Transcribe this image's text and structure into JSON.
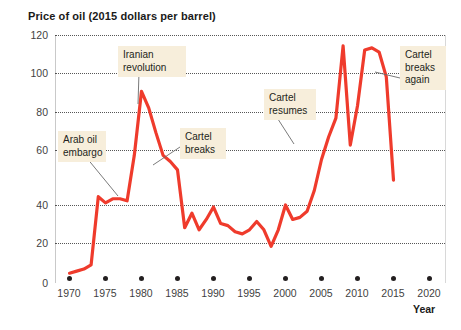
{
  "chart_data": {
    "type": "line",
    "title": "Price of oil (2015 dollars per barrel)",
    "xlabel": "Year",
    "ylabel": "",
    "xlim": [
      1968,
      2022
    ],
    "ylim": [
      0,
      120
    ],
    "grid": true,
    "legend_position": "none",
    "line_color": "#ef3b2c",
    "annotation_bg": "#f7eedb",
    "y_ticks": [
      0,
      20,
      40,
      60,
      80,
      100,
      120
    ],
    "x_ticks": [
      1970,
      1975,
      1980,
      1985,
      1990,
      1995,
      2000,
      2005,
      2010,
      2015,
      2020
    ],
    "series": [
      {
        "name": "Price of oil (2015 dollars per barrel)",
        "x": [
          1970,
          1971,
          1972,
          1973,
          1974,
          1975,
          1976,
          1977,
          1978,
          1979,
          1980,
          1981,
          1982,
          1983,
          1984,
          1985,
          1986,
          1987,
          1988,
          1989,
          1990,
          1991,
          1992,
          1993,
          1994,
          1995,
          1996,
          1997,
          1998,
          1999,
          2000,
          2001,
          2002,
          2003,
          2004,
          2005,
          2006,
          2007,
          2008,
          2009,
          2010,
          2011,
          2012,
          2013,
          2014,
          2015
        ],
        "y": [
          5,
          6,
          7,
          9,
          42,
          39,
          41,
          41,
          40,
          62,
          93,
          85,
          73,
          62,
          59,
          55,
          27,
          34,
          26,
          31,
          37,
          29,
          28,
          25,
          24,
          26,
          30,
          26,
          18,
          26,
          38,
          31,
          32,
          35,
          45,
          60,
          71,
          80,
          115,
          67,
          86,
          113,
          114,
          112,
          100,
          50
        ]
      }
    ],
    "annotations": [
      {
        "id": "arab-oil-embargo",
        "text": "Arab oil\nembargo",
        "x_px": 58,
        "y_px": 131,
        "w_px": 48,
        "leader": {
          "x1": 86,
          "y1": 157,
          "x2": 118,
          "y2": 196
        }
      },
      {
        "id": "iranian-revolution",
        "text": "Iranian\nrevolution",
        "x_px": 118,
        "y_px": 46,
        "w_px": 68,
        "leader": {
          "x1": 139,
          "y1": 72,
          "x2": 138,
          "y2": 104
        }
      },
      {
        "id": "cartel-breaks",
        "text": "Cartel\nbreaks",
        "x_px": 180,
        "y_px": 128,
        "w_px": 46,
        "leader": {
          "x1": 180,
          "y1": 147,
          "x2": 153,
          "y2": 165
        }
      },
      {
        "id": "cartel-resumes",
        "text": "Cartel\nresumes",
        "x_px": 264,
        "y_px": 89,
        "w_px": 52,
        "leader": {
          "x1": 276,
          "y1": 116,
          "x2": 294,
          "y2": 144
        }
      },
      {
        "id": "cartel-breaks-again",
        "text": "Cartel\nbreaks\nagain",
        "x_px": 400,
        "y_px": 46,
        "w_px": 46,
        "leader": {
          "x1": 400,
          "y1": 78,
          "x2": 375,
          "y2": 72
        }
      }
    ]
  }
}
